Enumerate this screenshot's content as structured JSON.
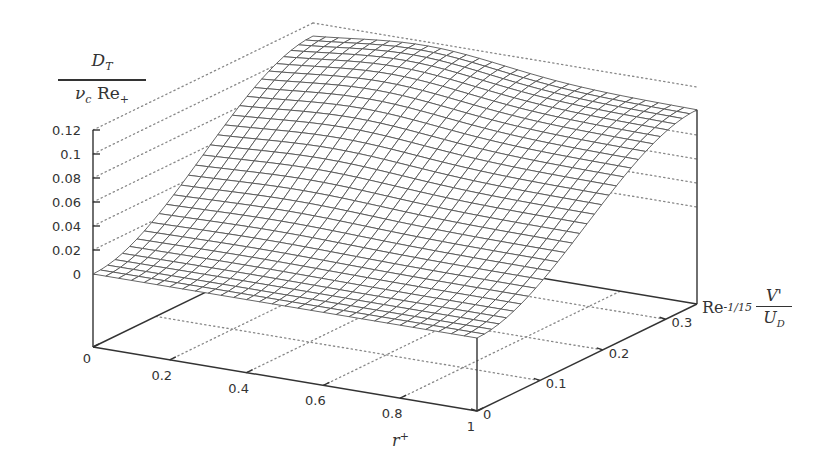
{
  "chart_data": {
    "type": "surface3d",
    "title": "",
    "xlabel": "r^+",
    "ylabel": "Re^{-1/15} V'/U_D",
    "zlabel": "D_T / (ν_c Re_+)",
    "xlim": [
      0,
      1
    ],
    "ylim": [
      0,
      0.35
    ],
    "zlim": [
      0,
      0.12
    ],
    "x_ticks": [
      "0",
      "0.2",
      "0.4",
      "0.6",
      "0.8",
      "1"
    ],
    "y_ticks": [
      "0",
      "0.1",
      "0.2",
      "0.3"
    ],
    "z_ticks": [
      "0",
      "0.02",
      "0.04",
      "0.06",
      "0.08",
      "0.1",
      "0.12"
    ],
    "grid": "dotted back walls",
    "mesh": {
      "nx": 30,
      "ny": 30
    },
    "surface_description": "D_T rises from 0 at V'=0 (front edge) to a peak of ~0.11-0.12 near r+~0.3 at the largest V' (back edge); at r+=1 back edge value ~0.11; zero along front edge for all r+",
    "sample_values": [
      {
        "r": 0.0,
        "v": 0.35,
        "z": 0.1
      },
      {
        "r": 0.3,
        "v": 0.35,
        "z": 0.118
      },
      {
        "r": 0.6,
        "v": 0.35,
        "z": 0.112
      },
      {
        "r": 1.0,
        "v": 0.35,
        "z": 0.11
      },
      {
        "r": 0.0,
        "v": 0.0,
        "z": 0.0
      },
      {
        "r": 1.0,
        "v": 0.0,
        "z": 0.0
      }
    ]
  },
  "labels": {
    "z_num": "D",
    "z_num_sub": "T",
    "z_den_nu": "ν",
    "z_den_nu_sub": "c",
    "z_den_re": " Re",
    "z_den_re_sub": "+",
    "y_re": "Re",
    "y_exp": "-1/15",
    "y_num": "V'",
    "y_den": "U",
    "y_den_sub": "D",
    "x_main": "r",
    "x_sup": "+"
  }
}
